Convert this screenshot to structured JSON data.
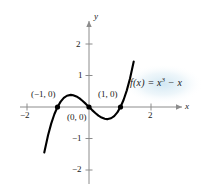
{
  "chart_data": {
    "type": "line",
    "title": "",
    "xlabel": "x",
    "ylabel": "y",
    "function_expression": "f(x) = x^3 - x",
    "xlim": [
      -2.45,
      2.45
    ],
    "ylim": [
      -2.7,
      2.75
    ],
    "grid": false,
    "legend": "none",
    "x_ticks": [
      -2,
      2
    ],
    "x_tick_labels": [
      "−2",
      "2"
    ],
    "y_ticks": [
      -2,
      -1,
      1,
      2
    ],
    "y_tick_labels": [
      "−2",
      "−1",
      "1",
      "2"
    ],
    "x": [
      -1.42,
      -1.3,
      -1.2,
      -1.1,
      -1.0,
      -0.9,
      -0.8,
      -0.7,
      -0.577,
      -0.5,
      -0.4,
      -0.3,
      -0.2,
      -0.1,
      0.0,
      0.1,
      0.2,
      0.3,
      0.4,
      0.5,
      0.577,
      0.6,
      0.7,
      0.8,
      0.9,
      1.0,
      1.1,
      1.2,
      1.3,
      1.42
    ],
    "y": [
      -1.444,
      -0.897,
      -0.528,
      -0.231,
      0.0,
      0.171,
      0.288,
      0.357,
      0.385,
      0.375,
      0.336,
      0.273,
      0.192,
      0.099,
      0.0,
      -0.099,
      -0.192,
      -0.273,
      -0.336,
      -0.375,
      -0.385,
      -0.384,
      -0.357,
      -0.288,
      -0.171,
      0.0,
      0.231,
      0.528,
      0.897,
      1.444
    ],
    "marked_points": [
      {
        "label": "(−1, 0)",
        "x": -1,
        "y": 0
      },
      {
        "label": "(0, 0)",
        "x": 0,
        "y": 0
      },
      {
        "label": "(1, 0)",
        "x": 1,
        "y": 0
      }
    ],
    "annotations": [
      {
        "name": "function-expression",
        "text_parts": {
          "prefix": "f(x) = x",
          "exponent": "3",
          "suffix": " − x"
        }
      }
    ],
    "colors": {
      "curve": "#000000",
      "axis": "#8c8c8c",
      "text": "#1a1a1a",
      "background": "#ffffff",
      "highlight_glow": "#dcedf5"
    }
  },
  "labels": {
    "y_axis_name": "y",
    "x_axis_name": "x",
    "y_tick_2": "2",
    "y_tick_1": "1",
    "y_tick_neg1": "−1",
    "y_tick_neg2": "−2",
    "x_tick_neg2": "−2",
    "x_tick_2": "2",
    "point_neg1": "(−1, 0)",
    "point_origin": "(0, 0)",
    "point_1": "(1, 0)",
    "fn_prefix": "f(x) = x",
    "fn_exponent": "3",
    "fn_suffix": " − x"
  }
}
